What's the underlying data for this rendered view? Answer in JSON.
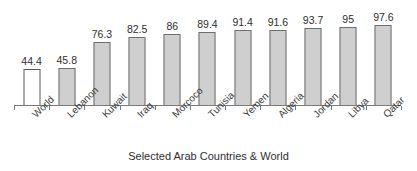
{
  "chart_data": {
    "type": "bar",
    "title": "",
    "subtitle": "",
    "xlabel": "Selected Arab Countries & World",
    "ylabel": "",
    "categories": [
      "World",
      "Lebanon",
      "Kuwait",
      "Iraq",
      "Morcoco",
      "Tunisia",
      "Yemen",
      "Algeria",
      "Jordan",
      "Libya",
      "Qatar"
    ],
    "values": [
      44.4,
      45.8,
      76.3,
      82.5,
      86,
      89.4,
      91.4,
      91.6,
      93.7,
      95,
      97.6
    ],
    "value_labels": [
      "44.4",
      "45.8",
      "76.3",
      "82.5",
      "86",
      "89.4",
      "91.4",
      "91.6",
      "93.7",
      "95",
      "97.6"
    ],
    "bar_styles": [
      "unfilled",
      "filled",
      "filled",
      "filled",
      "filled",
      "filled",
      "filled",
      "filled",
      "filled",
      "filled",
      "filled"
    ],
    "ylim": [
      0,
      120
    ],
    "grid": false,
    "legend": "none",
    "axis_line": true,
    "tick_marks": true,
    "label_rotation_deg": -45,
    "colors": {
      "bar_fill": "#cfcfcf",
      "bar_fill_unfilled": "#ffffff",
      "bar_border": "#6e6e6e",
      "axis": "#7a7a7a",
      "text": "#2e2e2e",
      "background": "#ffffff"
    }
  }
}
